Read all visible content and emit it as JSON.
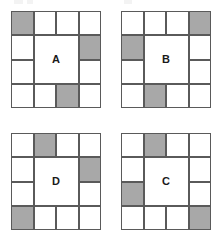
{
  "figure": {
    "type": "pattern-matrix-puzzle",
    "grid_columns": 4,
    "grid_rows": 4,
    "layout": {
      "columns": 2,
      "rows": 2
    },
    "colors": {
      "shaded_cell": "#a8a8a8",
      "empty_cell": "#ffffff",
      "stroke": "#5a5a5a",
      "letter": "#1a1a1a",
      "background": "#ffffff"
    },
    "squares": [
      {
        "id": "square-a",
        "label": "A",
        "position": "top-left",
        "shaded_cells": [
          {
            "row": 1,
            "col": 1
          },
          {
            "row": 2,
            "col": 4
          },
          {
            "row": 4,
            "col": 3
          }
        ]
      },
      {
        "id": "square-b",
        "label": "B",
        "position": "top-right",
        "shaded_cells": [
          {
            "row": 1,
            "col": 4
          },
          {
            "row": 2,
            "col": 1
          },
          {
            "row": 4,
            "col": 2
          }
        ]
      },
      {
        "id": "square-d",
        "label": "D",
        "position": "bottom-left",
        "shaded_cells": [
          {
            "row": 1,
            "col": 2
          },
          {
            "row": 2,
            "col": 4
          },
          {
            "row": 4,
            "col": 1
          }
        ]
      },
      {
        "id": "square-c",
        "label": "C",
        "position": "bottom-right",
        "shaded_cells": [
          {
            "row": 1,
            "col": 2
          },
          {
            "row": 3,
            "col": 1
          },
          {
            "row": 4,
            "col": 4
          }
        ]
      }
    ]
  }
}
